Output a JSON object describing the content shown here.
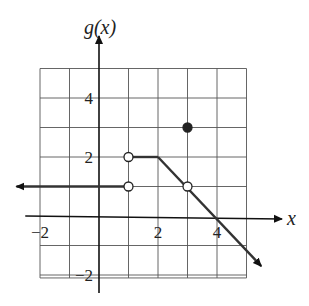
{
  "chart_data": {
    "type": "line",
    "title": "",
    "xlabel": "x",
    "ylabel": "g(x)",
    "xlim": [
      -2,
      5
    ],
    "ylim": [
      -2,
      5
    ],
    "grid": true,
    "x_ticks": [
      {
        "value": -2,
        "label": "−2"
      },
      {
        "value": 2,
        "label": "2"
      },
      {
        "value": 4,
        "label": "4"
      }
    ],
    "y_ticks": [
      {
        "value": 4,
        "label": "4"
      },
      {
        "value": 2,
        "label": "2"
      },
      {
        "value": -2,
        "label": "−2"
      }
    ],
    "segments": [
      {
        "name": "left ray",
        "from": [
          -2.8,
          1
        ],
        "to": [
          1,
          1
        ],
        "start": "arrow",
        "end": "open"
      },
      {
        "name": "flat segment",
        "from": [
          1,
          2
        ],
        "to": [
          2,
          2
        ],
        "start": "open",
        "end": "none"
      },
      {
        "name": "decreasing ray",
        "from": [
          2,
          2
        ],
        "to": [
          5.5,
          -1.7
        ],
        "start": "none",
        "end": "arrow"
      }
    ],
    "points": [
      {
        "x": 1,
        "y": 1,
        "type": "open"
      },
      {
        "x": 1,
        "y": 2,
        "type": "open"
      },
      {
        "x": 3,
        "y": 1,
        "type": "open"
      },
      {
        "x": 3,
        "y": 3,
        "type": "closed"
      }
    ]
  }
}
